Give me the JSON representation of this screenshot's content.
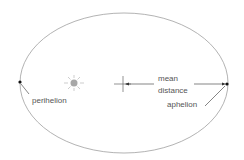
{
  "diagram": {
    "labels": {
      "perihelion": "perihelion",
      "mean_line1": "mean",
      "mean_line2": "distance",
      "aphelion": "aphelion"
    },
    "colors": {
      "orbit": "#a0a0a0",
      "sun": "#a8a8a8",
      "text": "#555555",
      "point": "#111111",
      "line": "#333333"
    }
  }
}
